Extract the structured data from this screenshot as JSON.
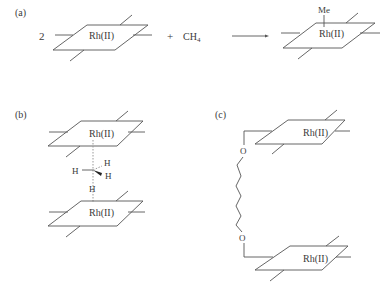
{
  "panels": {
    "a": {
      "label": "(a)",
      "coefficient": "2",
      "reactant_metal": "Rh(II)",
      "plus": "+",
      "methane": "CH",
      "methane_subscript": "4",
      "product_metal": "Rh(II)",
      "product_ligand": "Me"
    },
    "b": {
      "label": "(b)",
      "top_metal": "Rh(II)",
      "bottom_metal": "Rh(II)",
      "h_left": "H",
      "h_upper_right": "H",
      "h_lower_right": "H",
      "h_bottom": "H"
    },
    "c": {
      "label": "(c)",
      "top_metal": "Rh(II)",
      "bottom_metal": "Rh(II)",
      "oxygen_top": "O",
      "oxygen_bottom": "O"
    }
  },
  "colors": {
    "line": "#555555",
    "text": "#3a3a3a",
    "dotted": "#999999",
    "background": "#ffffff"
  }
}
